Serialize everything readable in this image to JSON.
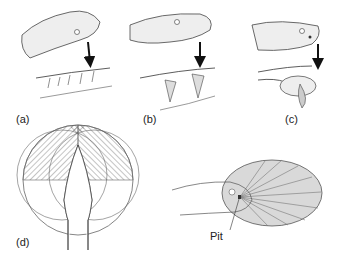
{
  "figure": {
    "panels": [
      {
        "id": "a",
        "label": "(a)",
        "description": "Snake head with arrow to fixed rear teeth (aglyphous dentition)"
      },
      {
        "id": "b",
        "label": "(b)",
        "description": "Snake head with arrow to grooved/fixed front fangs"
      },
      {
        "id": "c",
        "label": "(c)",
        "description": "Viper head with arrow to hinged folding fang"
      },
      {
        "id": "d",
        "label": "(d)",
        "description": "Top view of snake head with overlapping hatched pit-organ fields of view"
      }
    ],
    "pit_diagram": {
      "callout": "Pit",
      "fill_color": "#d9d9d9",
      "stroke_color": "#555555"
    }
  }
}
